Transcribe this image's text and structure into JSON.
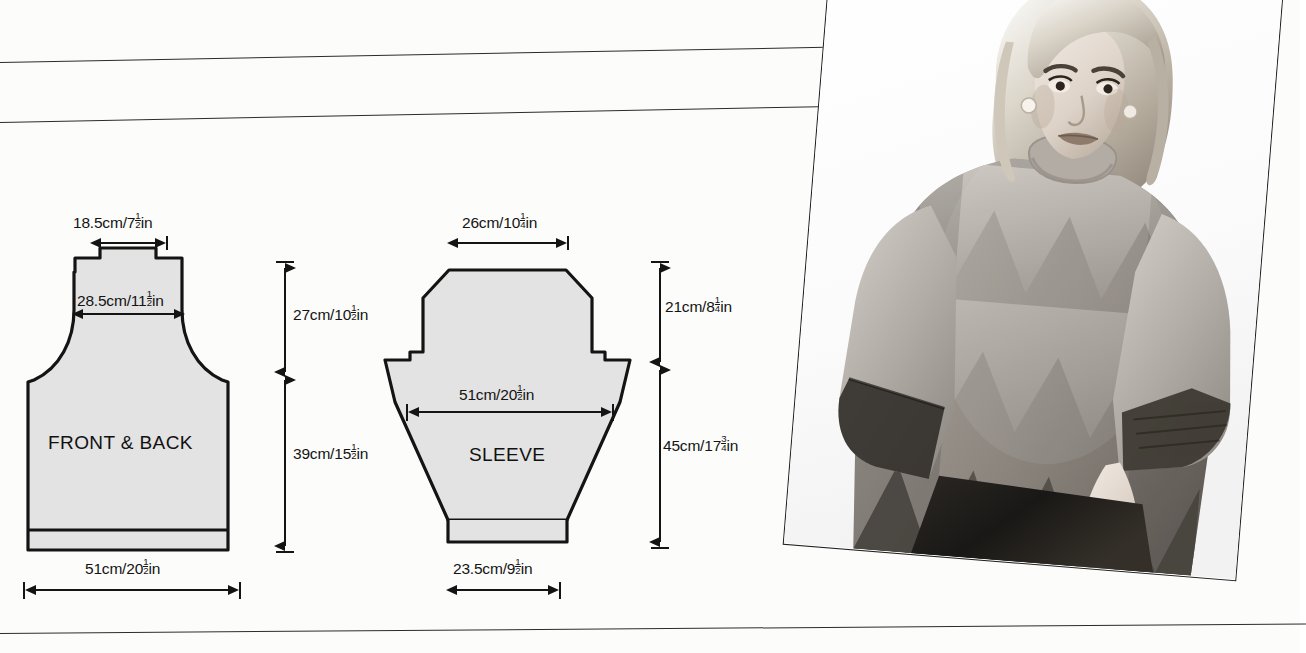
{
  "page": {
    "kind": "knitting-pattern-schematic",
    "background": "#fcfcfb",
    "ink": "#141414",
    "piece_fill": "#e3e3e3"
  },
  "pieces": [
    {
      "id": "front-back",
      "label": "FRONT & BACK"
    },
    {
      "id": "sleeve",
      "label": "SLEEVE"
    }
  ],
  "dimensions": {
    "front_back": {
      "neck_width": {
        "cm": "18.5cm/",
        "whole": "7",
        "num": "1",
        "den": "2",
        "unit": "in"
      },
      "shoulder_width": {
        "cm": "28.5cm/",
        "whole": "11",
        "num": "1",
        "den": "2",
        "unit": "in"
      },
      "yoke_height": {
        "cm": "27cm/",
        "whole": "10",
        "num": "1",
        "den": "2",
        "unit": "in"
      },
      "body_height": {
        "cm": "39cm/",
        "whole": "15",
        "num": "1",
        "den": "2",
        "unit": "in"
      },
      "hem_width": {
        "cm": "51cm/",
        "whole": "20",
        "num": "1",
        "den": "2",
        "unit": "in"
      }
    },
    "sleeve": {
      "top_width": {
        "cm": "26cm/",
        "whole": "10",
        "num": "1",
        "den": "4",
        "unit": "in"
      },
      "upper_width": {
        "cm": "51cm/",
        "whole": "20",
        "num": "1",
        "den": "2",
        "unit": "in"
      },
      "head_height": {
        "cm": "21cm/",
        "whole": "8",
        "num": "1",
        "den": "4",
        "unit": "in"
      },
      "length": {
        "cm": "45cm/",
        "whole": "17",
        "num": "3",
        "den": "4",
        "unit": "in"
      },
      "cuff_width": {
        "cm": "23.5cm/",
        "whole": "9",
        "num": "1",
        "den": "2",
        "unit": "in"
      }
    }
  },
  "photo": {
    "caption": "",
    "subject": "model wearing zigzag-patterned mohair sweater",
    "tone": "black-and-white photograph",
    "tilt_degrees": "4.6"
  }
}
